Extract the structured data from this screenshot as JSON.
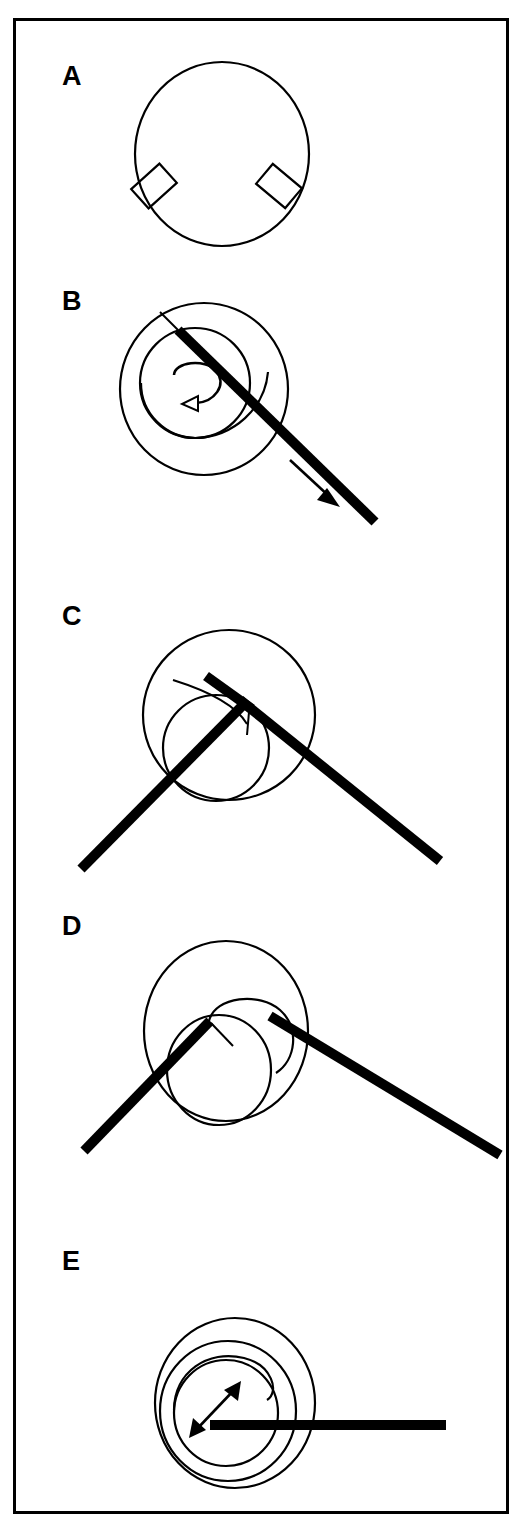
{
  "figure": {
    "background_color": "#ffffff",
    "line_color": "#000000",
    "border": {
      "name": "figure-border",
      "x": 13,
      "y": 18,
      "width": 495,
      "height": 1495,
      "stroke_width": 3
    },
    "panels": [
      {
        "id": "A",
        "label": "A",
        "label_x": 62,
        "label_y": 85,
        "description": "Open circle with two small tilted rectangles attached at lower-left and lower-right",
        "shapes": {
          "main_circle": {
            "cx": 222,
            "cy": 154,
            "rx": 87,
            "ry": 92
          },
          "rect_left": {
            "cx": 154,
            "cy": 186,
            "w": 38,
            "h": 26,
            "rotation": -42
          },
          "rect_right": {
            "cx": 279,
            "cy": 186,
            "w": 38,
            "h": 26,
            "rotation": 40
          }
        }
      },
      {
        "id": "B",
        "label": "B",
        "label_x": 62,
        "label_y": 310,
        "description": "Two offset circles with internal spiral and rotation arrow, crossed by a thick diagonal line with a parallel direction arrow",
        "shapes": {
          "outer_circle": {
            "cx": 204,
            "cy": 389,
            "rx": 84,
            "ry": 86
          },
          "inner_circle": {
            "cx": 195,
            "cy": 383,
            "rx": 55,
            "ry": 55
          },
          "thick_line": {
            "x1": 178,
            "y1": 328,
            "x2": 375,
            "y2": 522
          },
          "rotation_arrow": "counter-clockwise curved arrow, hollow head pointing left",
          "direction_arrow": {
            "x1": 294,
            "y1": 464,
            "x2": 335,
            "y2": 503,
            "head": "solid",
            "direction": "down-right"
          }
        }
      },
      {
        "id": "C",
        "label": "C",
        "label_x": 62,
        "label_y": 625,
        "description": "Two offset circles with a wide inverted-V (chevron) of thick lines meeting at a vertex near the circle centre",
        "shapes": {
          "outer_circle": {
            "cx": 229,
            "cy": 715,
            "rx": 86,
            "ry": 85
          },
          "inner_circle": {
            "cx": 216,
            "cy": 748,
            "rx": 53,
            "ry": 53
          },
          "vertex": {
            "x": 245,
            "y": 702
          },
          "left_arm": {
            "x1": 81,
            "y1": 869,
            "x2": 245,
            "y2": 702
          },
          "right_arm": {
            "x1": 245,
            "y1": 702,
            "x2": 440,
            "y2": 861
          },
          "stub": {
            "x1": 206,
            "y1": 676,
            "x2": 252,
            "y2": 708
          }
        }
      },
      {
        "id": "D",
        "label": "D",
        "label_x": 62,
        "label_y": 935,
        "description": "Two offset circles with a flatter asymmetric chevron of thick lines, vertex shifted right of centre",
        "shapes": {
          "outer_circle": {
            "cx": 226,
            "cy": 1031,
            "rx": 82,
            "ry": 90
          },
          "inner_circle": {
            "cx": 219,
            "cy": 1070,
            "rx": 52,
            "ry": 55
          },
          "inner_spiral": "arc sweeping from left of inner circle over the top to the right",
          "vertex": {
            "x": 280,
            "y": 1020
          },
          "left_arm": {
            "x1": 84,
            "y1": 1151,
            "x2": 208,
            "y2": 1022
          },
          "right_arm": {
            "x1": 272,
            "y1": 1017,
            "x2": 500,
            "y2": 1155
          },
          "stub": {
            "x1": 209,
            "y1": 1022,
            "x2": 232,
            "y2": 1045
          }
        }
      },
      {
        "id": "E",
        "label": "E",
        "label_x": 62,
        "label_y": 1270,
        "description": "Concentric offset circles with a horizontal thick line through them and a double-headed diagonal arrow inside",
        "shapes": {
          "outer_circle": {
            "cx": 235,
            "cy": 1403,
            "rx": 80,
            "ry": 85
          },
          "mid_circle": {
            "cx": 228,
            "cy": 1410,
            "rx": 68,
            "ry": 70
          },
          "inner_circle": {
            "cx": 226,
            "cy": 1412,
            "rx": 52,
            "ry": 53
          },
          "horizontal_line": {
            "x1": 210,
            "y1": 1425,
            "x2": 446,
            "y2": 1425
          },
          "double_arrow": {
            "x1": 194,
            "y1": 1432,
            "x2": 237,
            "y2": 1387,
            "heads": "both",
            "head_style": "solid"
          }
        }
      }
    ]
  }
}
